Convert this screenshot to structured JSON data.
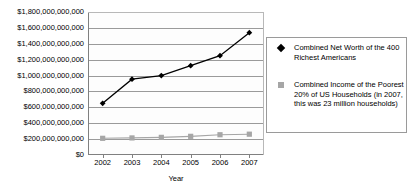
{
  "chart_data": {
    "type": "line",
    "title": "23 Million Poorest Households",
    "xlabel": "Year",
    "ylabel": "",
    "x": [
      "2002",
      "2003",
      "2004",
      "2005",
      "2006",
      "2007"
    ],
    "categories": [
      "2002",
      "2003",
      "2004",
      "2005",
      "2006",
      "2007"
    ],
    "ylim": [
      0,
      1800000000000
    ],
    "ytick_step": 200000000000,
    "ytick_labels": [
      "$1,800,000,000,000",
      "$1,600,000,000,000",
      "$1,400,000,000,000",
      "$1,200,000,000,000",
      "$1,000,000,000,000",
      "$800,000,000,000",
      "$600,000,000,000",
      "$400,000,000,000",
      "$200,000,000,000",
      "$0"
    ],
    "ytick_values": [
      1800000000000,
      1600000000000,
      1400000000000,
      1200000000000,
      1000000000000,
      800000000000,
      600000000000,
      400000000000,
      200000000000,
      0
    ],
    "grid": true,
    "legend_position": "right",
    "series": [
      {
        "name": "Combined Net Worth of the 400 Richest Americans",
        "color": "#000000",
        "marker": "diamond",
        "values": [
          650000000000,
          955000000000,
          1000000000000,
          1125000000000,
          1250000000000,
          1540000000000
        ]
      },
      {
        "name": "Combined Income of the Poorest 20% of US Households (in 2007, this was 23 million households)",
        "color": "#a6a6a6",
        "marker": "square",
        "values": [
          210000000000,
          215000000000,
          222000000000,
          235000000000,
          255000000000,
          262000000000
        ]
      }
    ]
  },
  "legend": {
    "entries": [
      {
        "label": "Combined Net Worth of the 400 Richest Americans",
        "marker": "diamond-marker",
        "color": "#000000"
      },
      {
        "label": "Combined Income of the Poorest 20% of US Households (in 2007, this was 23 million households)",
        "marker": "square-marker",
        "color": "#a6a6a6"
      }
    ]
  },
  "axes": {
    "x_title": "Year"
  }
}
